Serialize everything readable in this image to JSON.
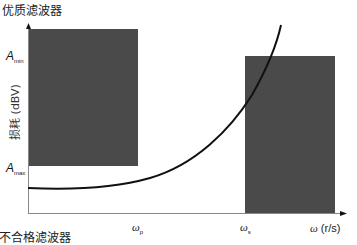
{
  "title": "优质滤波器",
  "caption": "不合格滤波器",
  "y_axis": {
    "label": "损耗 (dBV)",
    "ticks": [
      {
        "symbol": "A",
        "sub": "min"
      },
      {
        "symbol": "A",
        "sub": "max"
      }
    ]
  },
  "x_axis": {
    "label_symbol": "ω",
    "label_unit": "(r/s)",
    "ticks": [
      {
        "symbol": "ω",
        "sub": "p"
      },
      {
        "symbol": "ω",
        "sub": "s"
      }
    ]
  },
  "regions": [
    {
      "name": "passband-forbidden",
      "color": "#4a4a4a"
    },
    {
      "name": "stopband-forbidden",
      "color": "#4a4a4a"
    }
  ],
  "colors": {
    "box": "#4a4a4a",
    "curve": "#111111",
    "axis": "#888888"
  }
}
